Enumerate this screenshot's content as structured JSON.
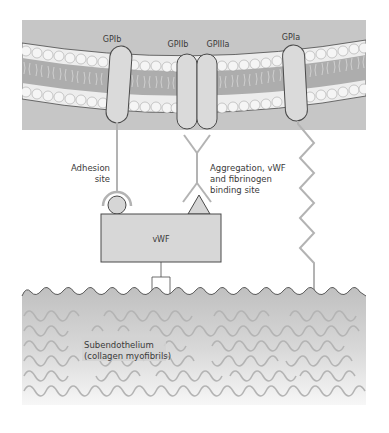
{
  "diagram": {
    "type": "biological schematic"
  },
  "membrane": {
    "receptors": [
      {
        "id": "gpib",
        "label": "GPIb"
      },
      {
        "id": "gpiib",
        "label": "GPIIb"
      },
      {
        "id": "gpiiia",
        "label": "GPIIIa"
      },
      {
        "id": "gpia",
        "label": "GPIa"
      }
    ]
  },
  "annotations": {
    "adhesion_line1": "Adhesion",
    "adhesion_line2": "site",
    "aggregation_line1": "Aggregation, vWF",
    "aggregation_line2": "and fibrinogen",
    "aggregation_line3": "binding site"
  },
  "vwf": {
    "label": "vWF"
  },
  "subendothelium": {
    "line1": "Subendothelium",
    "line2": "(collagen myofibrils)"
  },
  "colors": {
    "cytoplasm": "#c4c4c4",
    "bilayer_core": "#a9a9a9",
    "lipid_head": "#f4f4f4",
    "receptor_fill": "#d9d9d9",
    "outline": "#4a4a4a",
    "connector": "#b3b3b3",
    "vwf_fill": "#d6d6d6",
    "collagen_top": "#c2c2c2",
    "collagen_bottom": "#f6f6f6",
    "fibril": "#b0b0b0"
  }
}
